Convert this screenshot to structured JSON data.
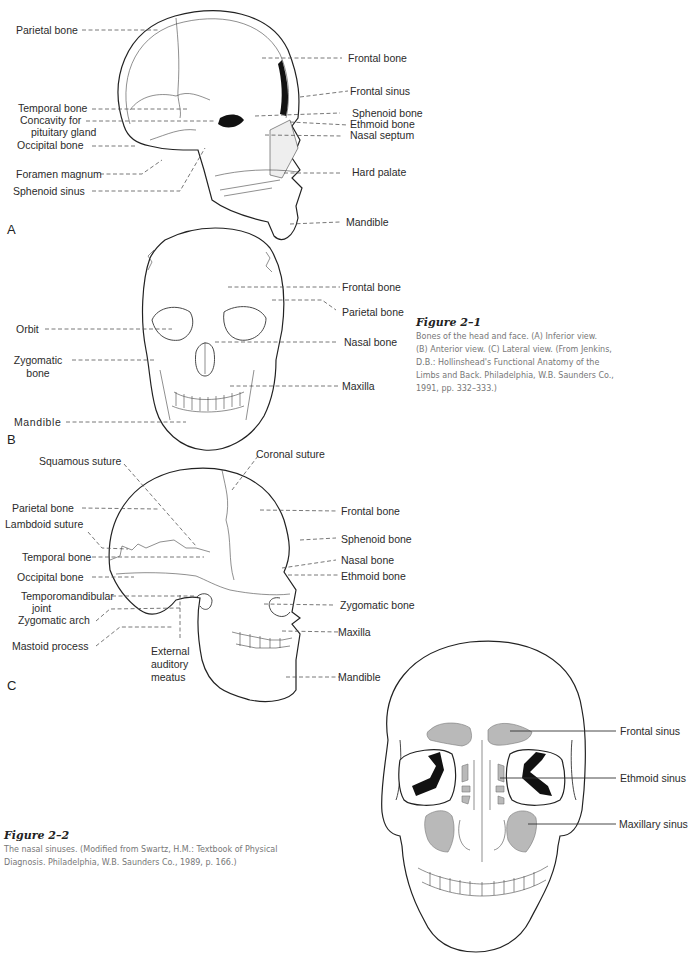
{
  "figure_a": {
    "letter": "A",
    "view": "Sagittal section",
    "labels_left": [
      "Parietal bone",
      "Temporal bone",
      "Concavity for",
      "pituitary gland",
      "Occipital bone",
      "Foramen magnum",
      "Sphenoid sinus"
    ],
    "labels_right": [
      "Frontal bone",
      "Frontal sinus",
      "Sphenoid bone",
      "Ethmoid bone",
      "Nasal septum",
      "Hard palate",
      "Mandible"
    ]
  },
  "figure_b": {
    "letter": "B",
    "view": "Anterior view",
    "labels_left": [
      "Orbit",
      "Zygomatic",
      "bone",
      "Mandible"
    ],
    "labels_right": [
      "Frontal bone",
      "Parietal bone",
      "Nasal bone",
      "Maxilla"
    ]
  },
  "figure_c": {
    "letter": "C",
    "view": "Lateral view",
    "labels_top": [
      "Squamous suture",
      "Coronal suture"
    ],
    "labels_left": [
      "Parietal bone",
      "Lambdoid suture",
      "Temporal bone",
      "Occipital bone",
      "Temporomandibular",
      "joint",
      "Zygomatic arch",
      "Mastoid process"
    ],
    "labels_bottom": [
      "External",
      "auditory",
      "meatus"
    ],
    "labels_right": [
      "Frontal bone",
      "Sphenoid bone",
      "Nasal bone",
      "Ethmoid bone",
      "Zygomatic bone",
      "Maxilla",
      "Mandible"
    ]
  },
  "caption_2_1": {
    "title": "Figure 2–1",
    "lines": [
      "Bones of the head and face. (A) Inferior view.",
      "(B) Anterior view. (C) Lateral view. (From Jenkins,",
      "D.B.: Hollinshead's Functional Anatomy of the",
      "Limbs and Back. Philadelphia, W.B. Saunders Co.,",
      "1991, pp. 332–333.)"
    ]
  },
  "figure_2_2": {
    "labels_right": [
      "Frontal sinus",
      "Ethmoid sinus",
      "Maxillary sinus"
    ],
    "sinus_color": "#b9b9b9"
  },
  "caption_2_2": {
    "title": "Figure 2–2",
    "lines": [
      "The nasal sinuses. (Modified from Swartz, H.M.: Textbook of Physical",
      "Diagnosis. Philadelphia, W.B. Saunders Co., 1989, p. 166.)"
    ]
  }
}
